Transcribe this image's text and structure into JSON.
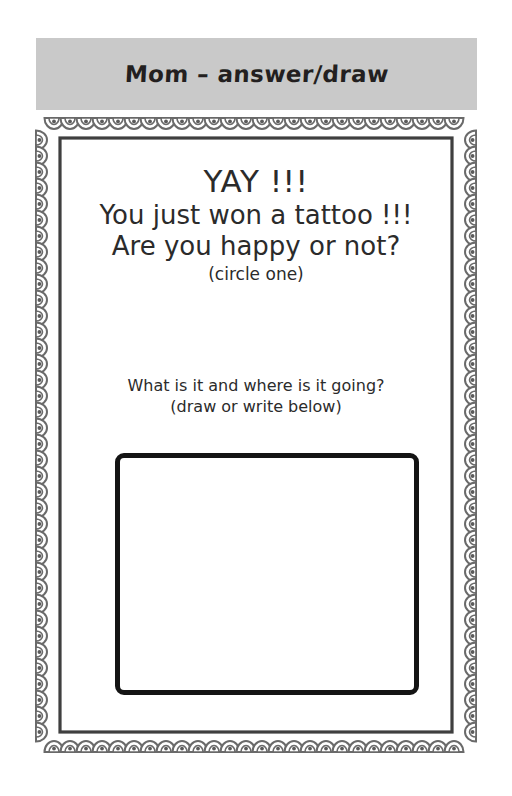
{
  "page": {
    "background_color": "#ffffff"
  },
  "header": {
    "title": "Mom – answer/draw",
    "background_color": "#c9c9c9"
  },
  "frame": {
    "style_name": "scalloped-shell-border",
    "color": "#6a6a6a",
    "inner_line_color": "#3f3f3f"
  },
  "main": {
    "lines": [
      "YAY !!!",
      "You just won a tattoo !!!",
      "Are you happy or not?",
      "(circle one)"
    ],
    "line_yay": "YAY !!!",
    "line_won": "You just won a tattoo !!!",
    "line_happy": "Are you happy or not?",
    "line_circle": "(circle one)"
  },
  "instruction": {
    "question": "What is it and where is it going?",
    "hint": "(draw or write below)"
  },
  "answer_box": {
    "border_color": "#141414",
    "fill_color": "#ffffff"
  }
}
